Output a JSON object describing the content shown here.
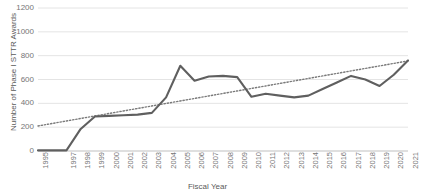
{
  "chart_data": {
    "type": "line",
    "title": "",
    "xlabel": "Fiscal Year",
    "ylabel": "Number of Phase I STTR Awards",
    "ylim": [
      0,
      1200
    ],
    "ytick_step": 200,
    "yticks": [
      1200,
      1000,
      800,
      600,
      400,
      200,
      0
    ],
    "grid": true,
    "legend": "none",
    "categories": [
      "1995",
      "1996",
      "1997",
      "1998",
      "1999",
      "2000",
      "2001",
      "2002",
      "2003",
      "2004",
      "2005",
      "2006",
      "2007",
      "2008",
      "2009",
      "2010",
      "2011",
      "2012",
      "2013",
      "2014",
      "2015",
      "2016",
      "2017",
      "2018",
      "2019",
      "2020",
      "2021"
    ],
    "tick_labels_shown": [
      "1995",
      "",
      "1997",
      "1998",
      "1999",
      "2000",
      "2001",
      "2002",
      "2003",
      "2004",
      "2005",
      "2006",
      "2007",
      "2008",
      "2009",
      "2010",
      "2011",
      "2012",
      "2013",
      "2014",
      "2015",
      "2016",
      "2017",
      "2018",
      "2019",
      "2020",
      "2021"
    ],
    "series": [
      {
        "name": "Phase I STTR Awards",
        "style": "solid",
        "color": "#5f5f5f",
        "values": [
          5,
          5,
          5,
          185,
          290,
          295,
          300,
          305,
          320,
          450,
          715,
          590,
          625,
          630,
          620,
          455,
          480,
          465,
          450,
          465,
          520,
          575,
          630,
          600,
          545,
          640,
          760
        ]
      },
      {
        "name": "Linear trendline",
        "style": "dotted",
        "color": "#7a7a7a",
        "values": [
          210,
          231,
          252,
          273,
          294,
          315,
          336,
          357,
          378,
          399,
          420,
          441,
          462,
          483,
          504,
          525,
          546,
          567,
          588,
          609,
          630,
          651,
          672,
          693,
          714,
          735,
          756
        ]
      }
    ],
    "colors": {
      "series_line": "#5f5f5f",
      "trendline": "#7a7a7a",
      "gridline": "#e4e4e4",
      "axis": "#bfbfbf",
      "tick_text": "#767676",
      "title_text": "#5a5a5a",
      "background": "#ffffff"
    }
  }
}
